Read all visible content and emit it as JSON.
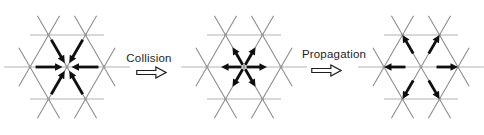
{
  "figure": {
    "kind": "triangular-lattice-gas-step-diagram",
    "steps": [
      {
        "label": "Collision"
      },
      {
        "label": "Propagation"
      }
    ],
    "panels": [
      {
        "id": "initial-state",
        "particle_arrows": {
          "count": 6,
          "directions": [
            "E",
            "NE",
            "NW",
            "W",
            "SW",
            "SE"
          ],
          "orientation": "pointing-inward-to-center-node"
        }
      },
      {
        "id": "after-collision",
        "particle_arrows": {
          "count": 6,
          "directions": [
            "E",
            "NE",
            "NW",
            "W",
            "SW",
            "SE"
          ],
          "orientation": "pointing-outward-from-center-node"
        }
      },
      {
        "id": "after-propagation",
        "particle_arrows": {
          "count": 6,
          "directions": [
            "E",
            "NE",
            "NW",
            "W",
            "SW",
            "SE"
          ],
          "orientation": "pointing-outward-at-neighbor-nodes"
        }
      }
    ],
    "colors": {
      "background": "#ffffff",
      "lattice_line_horizontal": "#b4b4b4",
      "lattice_line_diagonal": "#8e8e8e",
      "lattice_node": "#9a9a9a",
      "particle": "#0f0f0f",
      "label_text": "#1d1d1d",
      "block_arrow_outline": "#1d1d1d"
    },
    "geometry": {
      "canvas_w": 484,
      "canvas_h": 135,
      "lattice_constant": 37,
      "centers_x": [
        67,
        244,
        421
      ],
      "center_y": 67,
      "mid_line_half_span": 1.7,
      "line_overhang": 0.6,
      "arrow_spans": {
        "pointing-inward-to-center-node": {
          "tail": 0.85,
          "tip": 0.12
        },
        "pointing-outward-from-center-node": {
          "tail": 0.07,
          "tip": 0.62
        },
        "pointing-outward-at-neighbor-nodes": {
          "tail": 0.42,
          "tip": 1.0
        }
      },
      "arrow_shaft_width": 2.8,
      "arrow_head_length": 7.5,
      "arrow_head_half_width": 3.7
    }
  }
}
